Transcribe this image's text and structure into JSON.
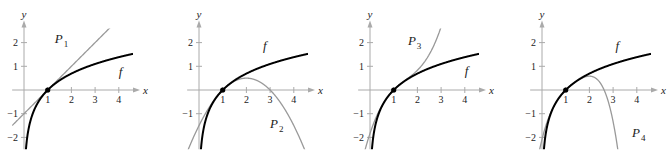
{
  "chart_data": [
    {
      "type": "line",
      "panel": 1,
      "title": "",
      "xlabel": "x",
      "ylabel": "y",
      "xlim": [
        -0.5,
        4.6
      ],
      "ylim": [
        -2.5,
        2.6
      ],
      "x_ticks": [
        1,
        2,
        3,
        4
      ],
      "y_ticks": [
        2,
        1,
        -1,
        -2
      ],
      "grid": false,
      "series": [
        {
          "name": "f",
          "expr": "ln(x)",
          "color": "#000000",
          "label": "f"
        },
        {
          "name": "P1",
          "expr": "(x-1)",
          "color": "#999999",
          "label": "P",
          "label_sub": "1"
        }
      ],
      "points": [
        {
          "x": 1,
          "y": 0
        }
      ],
      "labels": [
        {
          "text": "P",
          "sub": "1",
          "x": 1.3,
          "y": 2.0
        },
        {
          "text": "f",
          "x": 4.0,
          "y": 0.6
        }
      ]
    },
    {
      "type": "line",
      "panel": 2,
      "xlabel": "x",
      "ylabel": "y",
      "xlim": [
        -0.5,
        4.6
      ],
      "ylim": [
        -2.5,
        2.6
      ],
      "x_ticks": [
        1,
        2,
        3,
        4
      ],
      "y_ticks": [
        2,
        1,
        -1
      ],
      "grid": false,
      "series": [
        {
          "name": "f",
          "expr": "ln(x)",
          "color": "#000000",
          "label": "f"
        },
        {
          "name": "P2",
          "expr": "(x-1) - (x-1)^2/2",
          "color": "#999999",
          "label": "P",
          "label_sub": "2"
        }
      ],
      "points": [
        {
          "x": 1,
          "y": 0
        }
      ],
      "labels": [
        {
          "text": "f",
          "x": 2.7,
          "y": 1.7
        },
        {
          "text": "P",
          "sub": "2",
          "x": 3.0,
          "y": -1.6
        }
      ]
    },
    {
      "type": "line",
      "panel": 3,
      "xlabel": "x",
      "ylabel": "y",
      "xlim": [
        -0.5,
        4.6
      ],
      "ylim": [
        -2.5,
        2.6
      ],
      "x_ticks": [
        1,
        2,
        3,
        4
      ],
      "y_ticks": [
        2,
        1,
        -1,
        -2
      ],
      "grid": false,
      "series": [
        {
          "name": "f",
          "expr": "ln(x)",
          "color": "#000000",
          "label": "f"
        },
        {
          "name": "P3",
          "expr": "(x-1) - (x-1)^2/2 + (x-1)^3/3",
          "color": "#999999",
          "label": "P",
          "label_sub": "3"
        }
      ],
      "points": [
        {
          "x": 1,
          "y": 0
        }
      ],
      "labels": [
        {
          "text": "P",
          "sub": "3",
          "x": 1.6,
          "y": 1.9
        },
        {
          "text": "f",
          "x": 4.0,
          "y": 0.65
        }
      ]
    },
    {
      "type": "line",
      "panel": 4,
      "xlabel": "x",
      "ylabel": "y",
      "xlim": [
        -0.5,
        4.6
      ],
      "ylim": [
        -2.5,
        2.6
      ],
      "x_ticks": [
        1,
        2,
        3,
        4
      ],
      "y_ticks": [
        2,
        1,
        -1,
        -2
      ],
      "grid": false,
      "series": [
        {
          "name": "f",
          "expr": "ln(x)",
          "color": "#000000",
          "label": "f"
        },
        {
          "name": "P4",
          "expr": "(x-1) - (x-1)^2/2 + (x-1)^3/3 - (x-1)^4/4",
          "color": "#999999",
          "label": "P",
          "label_sub": "4"
        }
      ],
      "points": [
        {
          "x": 1,
          "y": 0
        }
      ],
      "labels": [
        {
          "text": "f",
          "x": 3.1,
          "y": 1.7
        },
        {
          "text": "P",
          "sub": "4",
          "x": 3.8,
          "y": -2.0
        }
      ]
    }
  ],
  "layout": {
    "panel_origins_px": [
      [
        24,
        90
      ],
      [
        199,
        90
      ],
      [
        370,
        90
      ],
      [
        542,
        90
      ]
    ],
    "unit_px": 23.7
  }
}
